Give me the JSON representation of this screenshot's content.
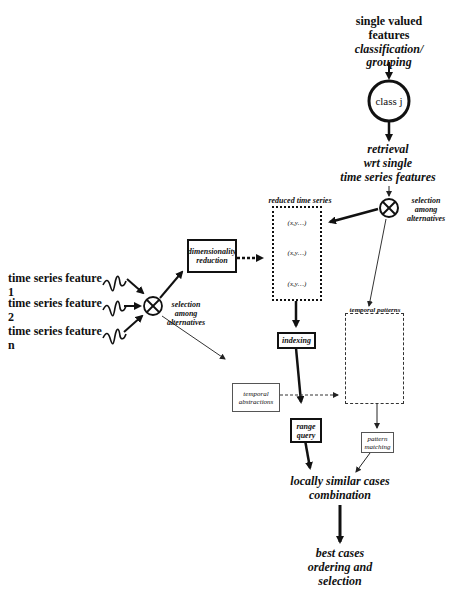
{
  "top": {
    "single_valued": "single valued",
    "features": "features",
    "classification": "classification/",
    "grouping": "grouping"
  },
  "class_node": {
    "label": "class j"
  },
  "retrieval": {
    "line1": "retrieval",
    "line2": "wrt single",
    "line3": "time series features"
  },
  "selection_right": {
    "line1": "selection",
    "line2": "among",
    "line3": "alternatives"
  },
  "selection_left": {
    "line1": "selection",
    "line2": "among",
    "line3": "alternatives"
  },
  "inputs": [
    {
      "label": "time series feature 1"
    },
    {
      "label": "time series feature 2"
    },
    {
      "label": "time series feature n"
    }
  ],
  "dim_reduction": {
    "line1": "dimensionality",
    "line2": "reduction"
  },
  "reduced_ts": {
    "title": "reduced time series",
    "items": [
      "(x,y…)",
      "(x,y…)",
      "(x,y…)"
    ]
  },
  "indexing": {
    "label": "indexing"
  },
  "temporal_abstractions": {
    "line1": "temporal",
    "line2": "abstractions"
  },
  "range_query": {
    "line1": "range",
    "line2": "query"
  },
  "temporal_patterns": {
    "title": "temporal patterns"
  },
  "pattern_matching": {
    "line1": "pattern",
    "line2": "matching"
  },
  "combination": {
    "line1": "locally similar cases",
    "line2": "combination"
  },
  "best_cases": {
    "line1": "best cases",
    "line2": "ordering and",
    "line3": "selection"
  }
}
